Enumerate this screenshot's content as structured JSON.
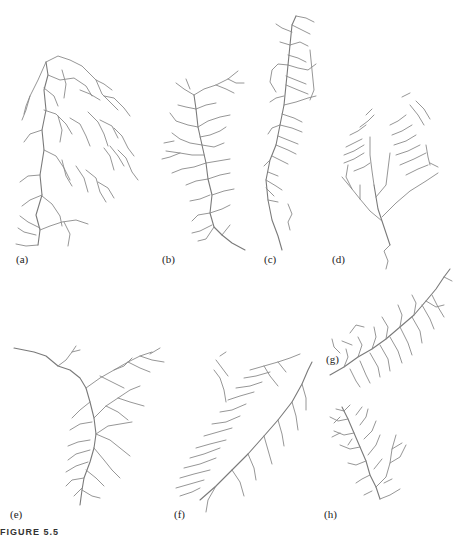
{
  "figure": {
    "caption": "FIGURE 5.5",
    "stroke_color": "#8a8a8a",
    "background": "#ffffff",
    "panels": [
      {
        "id": "a",
        "label": "(a)",
        "description": "dendritic drainage network, broad upper basin"
      },
      {
        "id": "b",
        "label": "(b)",
        "description": "elongated dendritic network with single trunk stream"
      },
      {
        "id": "c",
        "label": "(c)",
        "description": "narrow elongated network with parallel short tributaries"
      },
      {
        "id": "d",
        "label": "(d)",
        "description": "fan-shaped network with parallel tributaries converging to outlet"
      },
      {
        "id": "e",
        "label": "(e)",
        "description": "T-shaped dendritic network with long headwater channel"
      },
      {
        "id": "f",
        "label": "(f)",
        "description": "diagonal elongated network with dense pinnate tributaries"
      },
      {
        "id": "g",
        "label": "(g)",
        "description": "diagonal pinnate network, upper right"
      },
      {
        "id": "h",
        "label": "(h)",
        "description": "compact dense dendritic network"
      }
    ]
  }
}
